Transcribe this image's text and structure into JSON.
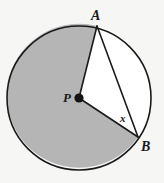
{
  "figure": {
    "background_color": "#f6f6f5",
    "stroke_color": "#1a1a1a",
    "shaded_color": "#b5b5b5",
    "unshaded_color": "#ffffff",
    "circle": {
      "center_x": 79,
      "center_y": 98,
      "radius": 72,
      "center_point_label": "P"
    },
    "points": [
      {
        "name": "A",
        "label": "A",
        "x": 97,
        "y": 26
      },
      {
        "name": "B",
        "label": "B",
        "x": 138,
        "y": 137
      },
      {
        "name": "P",
        "label": "P",
        "x": 79,
        "y": 98
      }
    ],
    "segments": [
      {
        "name": "radius-PA",
        "from": "P",
        "to": "A"
      },
      {
        "name": "radius-PB",
        "from": "P",
        "to": "B"
      },
      {
        "name": "chord-AB",
        "from": "A",
        "to": "B"
      }
    ],
    "angle_label": "x",
    "angle_label_note": "inscribed angle at B between chord BA and radius BP",
    "shaded_region": "major sector APB (reflex side)",
    "labels": {
      "A": "A",
      "B": "B",
      "P": "P",
      "x": "x"
    }
  }
}
